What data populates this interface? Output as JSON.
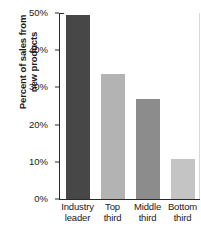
{
  "chart_data": {
    "type": "bar",
    "title": "",
    "subtitle": "",
    "xlabel": "",
    "ylabel": "Percent of sales from new products",
    "ylabel_lines": [
      "Percent of sales from",
      "new products"
    ],
    "categories": [
      "Industry leader",
      "Top third",
      "Middle third",
      "Bottom third"
    ],
    "category_lines": [
      [
        "Industry",
        "leader"
      ],
      [
        "Top",
        "third"
      ],
      [
        "Middle",
        "third"
      ],
      [
        "Bottom",
        "third"
      ]
    ],
    "values": [
      49.4,
      33.5,
      26.8,
      10.7
    ],
    "value_labels": [
      "49%",
      "34%",
      "27%",
      "11%"
    ],
    "ylim": [
      0,
      50
    ],
    "ytick_values": [
      0,
      10,
      20,
      30,
      40,
      50
    ],
    "ytick_labels": [
      "0%",
      "10%",
      "20%",
      "30%",
      "40%",
      "50%"
    ],
    "grid": false,
    "legend": "none",
    "bar_colors": [
      "#474747",
      "#b3b3b3",
      "#8c8c8c",
      "#c4c4c4"
    ],
    "axis_color": "#2b2b2b",
    "background_color": "#ffffff",
    "text_color": "#1a1a1a"
  }
}
